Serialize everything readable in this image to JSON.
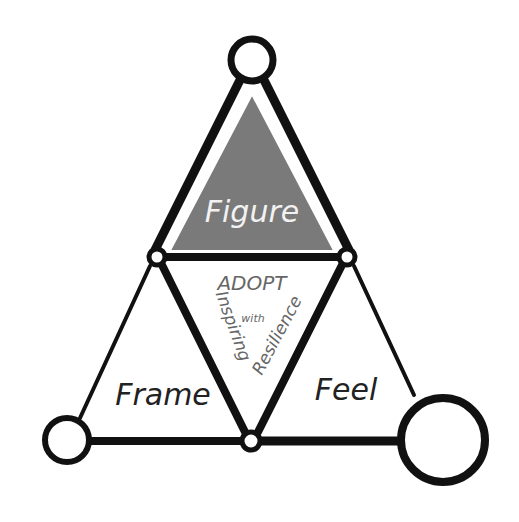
{
  "diagram": {
    "title": "ADOPT with Inspiring Resilience",
    "center": {
      "line1": "ADOPT",
      "line2": "with",
      "left_text": "Inspiring",
      "right_text": "Resilience"
    },
    "triangles": [
      {
        "label": "Figure",
        "fill": "#7a7a7a",
        "text_color": "#f2f2f2"
      },
      {
        "label": "Frame",
        "fill": "#ffffff",
        "text_color": "#222222"
      },
      {
        "label": "Feel",
        "fill": "#ffffff",
        "text_color": "#222222"
      }
    ],
    "colors": {
      "stroke": "#111111",
      "figure_fill": "#7a7a7a",
      "center_text": "#666666",
      "background": "#ffffff"
    }
  }
}
